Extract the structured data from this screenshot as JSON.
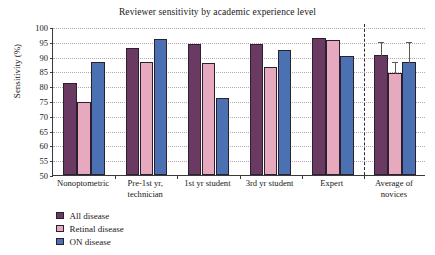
{
  "chart_data": {
    "type": "bar",
    "title": "Reviewer sensitivity by academic experience level",
    "xlabel": "",
    "ylabel": "Sensitivity (%)",
    "ylim": [
      50,
      100
    ],
    "ytick_step": 5,
    "yticks": [
      50,
      55,
      60,
      65,
      70,
      75,
      80,
      85,
      90,
      95,
      100
    ],
    "grid": "horizontal-dotted",
    "legend_position": "below-left",
    "categories": [
      "Nonoptometric",
      "Pre-1st yr,\ntechnician",
      "1st yr student",
      "3rd yr student",
      "Expert",
      "Average of\nnovices"
    ],
    "series": [
      {
        "name": "All disease",
        "color": "#6b3a63",
        "values": [
          81.0,
          93.0,
          94.3,
          94.1,
          96.3,
          90.7
        ],
        "errors_upper": [
          null,
          null,
          null,
          null,
          null,
          95.3
        ]
      },
      {
        "name": "Retinal disease",
        "color": "#e7a9bd",
        "values": [
          74.7,
          88.1,
          88.0,
          86.5,
          95.7,
          84.3
        ],
        "errors_upper": [
          null,
          null,
          null,
          null,
          null,
          88.6
        ]
      },
      {
        "name": "ON disease",
        "color": "#4c71b2",
        "values": [
          88.1,
          96.1,
          76.0,
          92.1,
          90.1,
          88.1
        ],
        "errors_upper": [
          null,
          null,
          null,
          null,
          null,
          95.4
        ]
      }
    ],
    "annotations": [
      {
        "type": "vertical-dashed-divider",
        "after_category_index": 4
      }
    ]
  }
}
